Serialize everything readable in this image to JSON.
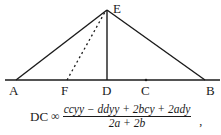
{
  "diagram": {
    "points": {
      "A": {
        "label": "A",
        "x": 16,
        "y": 80
      },
      "F": {
        "label": "F",
        "x": 67,
        "y": 80
      },
      "D": {
        "label": "D",
        "x": 107,
        "y": 80
      },
      "C": {
        "label": "C",
        "x": 146,
        "y": 80
      },
      "B": {
        "label": "B",
        "x": 205,
        "y": 80
      },
      "E": {
        "label": "E",
        "x": 107,
        "y": 10
      }
    },
    "segments": [
      {
        "from": "A",
        "to": "E",
        "style": "solid"
      },
      {
        "from": "E",
        "to": "B",
        "style": "solid"
      },
      {
        "from": "E",
        "to": "D",
        "style": "solid"
      },
      {
        "from": "F",
        "to": "E",
        "style": "dotted"
      }
    ],
    "baseline": {
      "x1": 5,
      "x2": 220,
      "y": 80
    },
    "line_color": "#1a1a1a"
  },
  "formula": {
    "lhs": "DC",
    "relation": "∞",
    "numerator": "ccyy − ddyy + 2bcy + 2ady",
    "denominator": "2a + 2b",
    "trailing": ","
  }
}
